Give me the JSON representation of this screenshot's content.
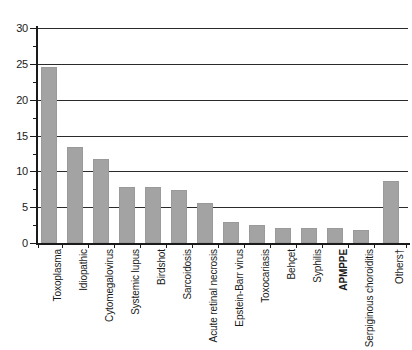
{
  "chart_data": {
    "type": "bar",
    "title": "",
    "subtitle": "",
    "xlabel": "",
    "ylabel": "",
    "ylim": [
      0,
      30
    ],
    "ytick_step": 5,
    "yticks": [
      "0",
      "5",
      "10",
      "15",
      "20",
      "25",
      "30"
    ],
    "grid": "horizontal",
    "legend": "none",
    "bar_color": "#a3a3a3",
    "axis_color": "#1a1a1a",
    "gridline_color": "#2b2b2b",
    "categories": [
      "Toxoplasma",
      "Idiopathic",
      "Cytomegalovirus",
      "Systemic lupus",
      "Birdshot",
      "Sarcoidosis",
      "Acute retinal necrosis",
      "Epstein-Barr virus",
      "Toxocariasis",
      "Behçet",
      "Syphilis",
      "APMPPE",
      "Serpiginous choroiditis",
      "Others†"
    ],
    "bold_categories": [
      "APMPPE"
    ],
    "values": [
      24.6,
      13.4,
      11.7,
      7.8,
      7.8,
      7.4,
      5.6,
      2.9,
      2.5,
      2.1,
      2.1,
      2.1,
      1.8,
      8.7
    ]
  }
}
